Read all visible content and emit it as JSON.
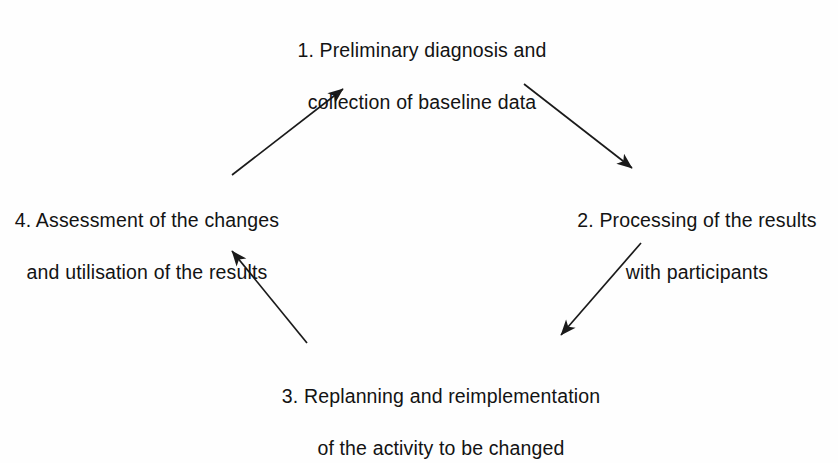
{
  "diagram": {
    "type": "cycle",
    "stroke_color": "#1a1a1a",
    "background_color": "#fefefe",
    "text_color": "#131313",
    "nodes": [
      {
        "id": "node-1",
        "number": "1.",
        "line1": "1. Preliminary diagnosis and",
        "line2": "collection of baseline data",
        "full_text": "1. Preliminary diagnosis and collection of baseline data",
        "position": "top"
      },
      {
        "id": "node-2",
        "number": "2.",
        "line1": "2. Processing of the results",
        "line2": "with participants",
        "full_text": "2. Processing of the results with participants",
        "position": "right"
      },
      {
        "id": "node-3",
        "number": "3.",
        "line1": "3. Replanning and reimplementation",
        "line2": "of the activity to be changed",
        "full_text": "3. Replanning and reimplementation of the activity to be changed",
        "position": "bottom"
      },
      {
        "id": "node-4",
        "number": "4.",
        "line1": "4. Assessment of the changes",
        "line2": "and utilisation of the results",
        "full_text": "4. Assessment of the changes and utilisation of the results",
        "position": "left"
      }
    ],
    "arrows": [
      {
        "id": "arrow-1-to-2",
        "from": "node-1",
        "to": "node-2",
        "x1": 524,
        "y1": 84,
        "x2": 637,
        "y2": 173,
        "direction": "down-right"
      },
      {
        "id": "arrow-2-to-3",
        "from": "node-2",
        "to": "node-3",
        "x1": 641,
        "y1": 243,
        "x2": 556,
        "y2": 341,
        "direction": "down-left"
      },
      {
        "id": "arrow-3-to-4",
        "from": "node-3",
        "to": "node-4",
        "x1": 307,
        "y1": 343,
        "x2": 227,
        "y2": 245,
        "direction": "up-left"
      },
      {
        "id": "arrow-4-to-1",
        "from": "node-4",
        "to": "node-1",
        "x1": 232,
        "y1": 175,
        "x2": 348,
        "y2": 85,
        "direction": "up-right"
      }
    ]
  }
}
